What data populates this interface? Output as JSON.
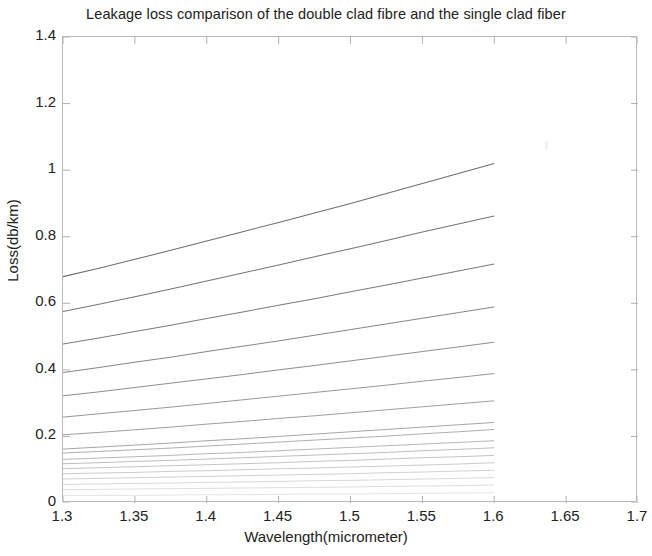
{
  "chart_data": {
    "type": "line",
    "title": "Leakage loss comparison of the double clad fibre and the single clad fiber",
    "xlabel": "Wavelength(micrometer)",
    "ylabel": "Loss(db/km)",
    "xlim": [
      1.3,
      1.7
    ],
    "ylim": [
      0,
      1.4
    ],
    "xticks": [
      "1.3",
      "1.35",
      "1.4",
      "1.45",
      "1.5",
      "1.55",
      "1.6",
      "1.65",
      "1.7"
    ],
    "xtick_values": [
      1.3,
      1.35,
      1.4,
      1.45,
      1.5,
      1.55,
      1.6,
      1.65,
      1.7
    ],
    "yticks": [
      "0",
      "0.2",
      "0.4",
      "0.6",
      "0.8",
      "1",
      "1.2",
      "1.4"
    ],
    "ytick_values": [
      0,
      0.2,
      0.4,
      0.6,
      0.8,
      1.0,
      1.2,
      1.4
    ],
    "grid": false,
    "legend": null,
    "legend_position": "none",
    "line_color": "#8a8a8a",
    "data_x_range": [
      1.3,
      1.6
    ],
    "x": [
      1.3,
      1.325,
      1.35,
      1.375,
      1.4,
      1.425,
      1.45,
      1.475,
      1.5,
      1.525,
      1.55,
      1.575,
      1.6
    ],
    "series": [
      {
        "name": "curve-1",
        "values": [
          0.68,
          0.705,
          0.732,
          0.759,
          0.787,
          0.815,
          0.843,
          0.871,
          0.9,
          0.93,
          0.96,
          0.99,
          1.02
        ]
      },
      {
        "name": "curve-2",
        "values": [
          0.575,
          0.597,
          0.62,
          0.643,
          0.667,
          0.691,
          0.715,
          0.74,
          0.764,
          0.789,
          0.814,
          0.838,
          0.862
        ]
      },
      {
        "name": "curve-3",
        "values": [
          0.478,
          0.496,
          0.515,
          0.534,
          0.554,
          0.574,
          0.594,
          0.614,
          0.635,
          0.655,
          0.676,
          0.697,
          0.718
        ]
      },
      {
        "name": "curve-4",
        "values": [
          0.392,
          0.407,
          0.423,
          0.438,
          0.455,
          0.471,
          0.487,
          0.504,
          0.521,
          0.538,
          0.555,
          0.572,
          0.589
        ]
      },
      {
        "name": "curve-5",
        "values": [
          0.322,
          0.334,
          0.347,
          0.36,
          0.373,
          0.386,
          0.4,
          0.413,
          0.427,
          0.441,
          0.455,
          0.469,
          0.483
        ]
      },
      {
        "name": "curve-6",
        "values": [
          0.258,
          0.268,
          0.278,
          0.288,
          0.299,
          0.31,
          0.321,
          0.332,
          0.343,
          0.354,
          0.366,
          0.377,
          0.389
        ]
      },
      {
        "name": "curve-7",
        "values": [
          0.205,
          0.212,
          0.22,
          0.228,
          0.237,
          0.245,
          0.254,
          0.262,
          0.271,
          0.28,
          0.289,
          0.298,
          0.307
        ]
      },
      {
        "name": "curve-8",
        "values": [
          0.162,
          0.168,
          0.174,
          0.18,
          0.187,
          0.193,
          0.2,
          0.207,
          0.214,
          0.221,
          0.228,
          0.235,
          0.242
        ]
      },
      {
        "name": "curve-9",
        "values": [
          0.15,
          0.155,
          0.16,
          0.165,
          0.171,
          0.177,
          0.183,
          0.189,
          0.195,
          0.201,
          0.208,
          0.214,
          0.221
        ]
      },
      {
        "name": "curve-10",
        "values": [
          0.131,
          0.135,
          0.139,
          0.143,
          0.148,
          0.152,
          0.157,
          0.162,
          0.167,
          0.172,
          0.177,
          0.182,
          0.187
        ]
      },
      {
        "name": "curve-11",
        "values": [
          0.118,
          0.121,
          0.125,
          0.128,
          0.132,
          0.136,
          0.14,
          0.144,
          0.148,
          0.152,
          0.157,
          0.161,
          0.166
        ]
      },
      {
        "name": "curve-12",
        "values": [
          0.103,
          0.106,
          0.109,
          0.112,
          0.115,
          0.118,
          0.121,
          0.125,
          0.128,
          0.132,
          0.136,
          0.139,
          0.143
        ]
      },
      {
        "name": "curve-13",
        "values": [
          0.088,
          0.09,
          0.092,
          0.095,
          0.097,
          0.1,
          0.103,
          0.105,
          0.108,
          0.111,
          0.114,
          0.117,
          0.121
        ]
      },
      {
        "name": "curve-14",
        "values": [
          0.072,
          0.074,
          0.076,
          0.078,
          0.08,
          0.082,
          0.084,
          0.086,
          0.088,
          0.091,
          0.093,
          0.096,
          0.098
        ]
      },
      {
        "name": "curve-15",
        "values": [
          0.056,
          0.057,
          0.059,
          0.06,
          0.062,
          0.063,
          0.065,
          0.067,
          0.068,
          0.07,
          0.072,
          0.074,
          0.076
        ]
      },
      {
        "name": "curve-16",
        "values": [
          0.04,
          0.041,
          0.042,
          0.043,
          0.044,
          0.045,
          0.046,
          0.047,
          0.048,
          0.05,
          0.051,
          0.052,
          0.054
        ]
      },
      {
        "name": "curve-17",
        "values": [
          0.022,
          0.023,
          0.023,
          0.024,
          0.025,
          0.025,
          0.026,
          0.027,
          0.027,
          0.028,
          0.029,
          0.03,
          0.031
        ]
      }
    ]
  },
  "title": "Leakage loss comparison of the double clad fibre and the single clad fiber",
  "axes": {
    "xlabel": "Wavelength(micrometer)",
    "ylabel": "Loss(db/km)"
  }
}
